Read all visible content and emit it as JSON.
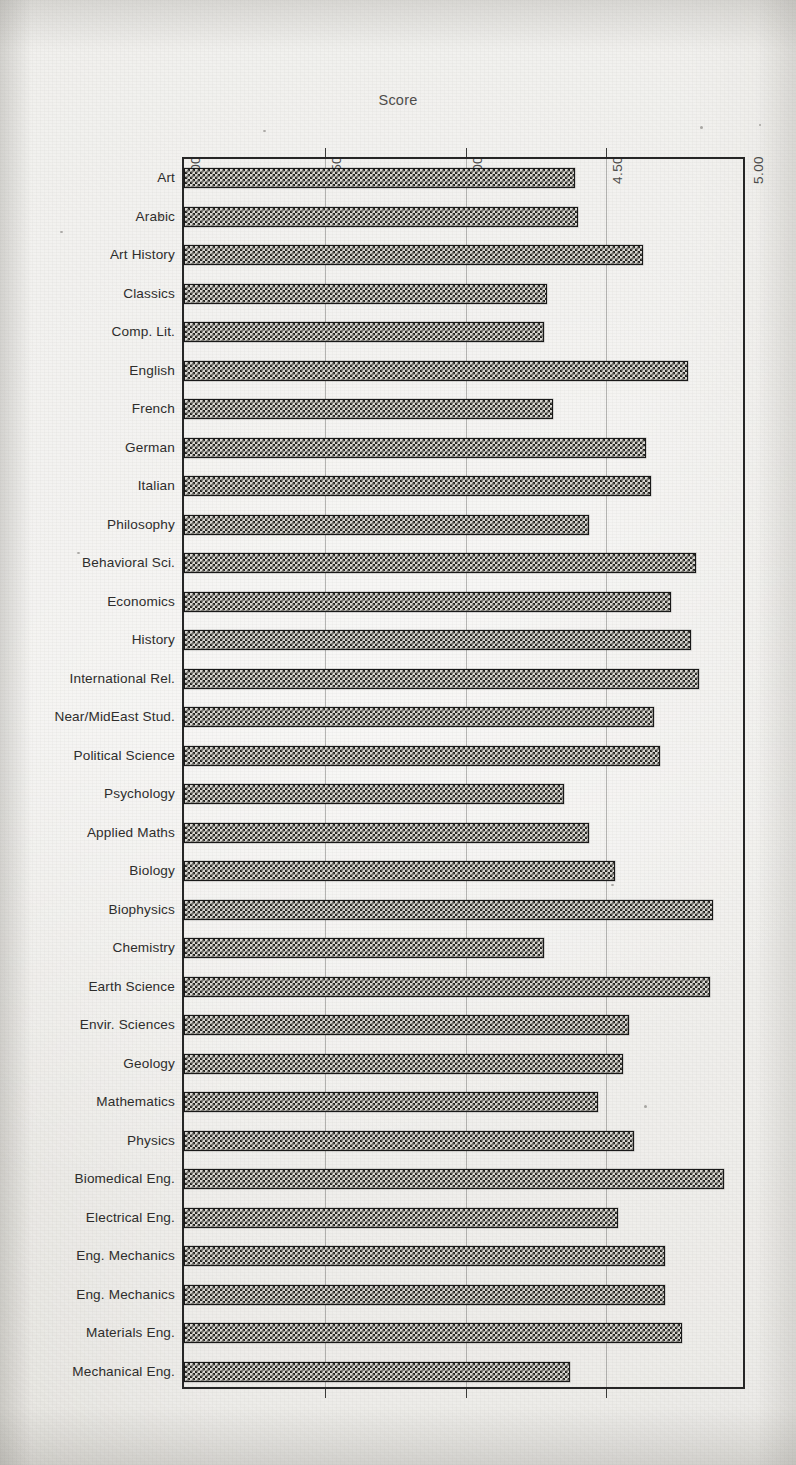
{
  "chart_data": {
    "type": "bar",
    "orientation": "horizontal",
    "title": "",
    "xlabel": "Score",
    "ylabel": "",
    "xlim": [
      3.0,
      5.0
    ],
    "xticks": [
      3.0,
      3.5,
      4.0,
      4.5,
      5.0
    ],
    "xtick_labels": [
      "3.00",
      "3.50",
      "4.00",
      "4.50",
      "5.00"
    ],
    "grid": true,
    "gridlines_at": [
      3.5,
      4.0,
      4.5
    ],
    "legend": null,
    "bar_fill": "checkerboard-hatch",
    "categories": [
      "Art",
      "Arabic",
      "Art History",
      "Classics",
      "Comp. Lit.",
      "English",
      "French",
      "German",
      "Italian",
      "Philosophy",
      "Behavioral Sci.",
      "Economics",
      "History",
      "International Rel.",
      "Near/MidEast Stud.",
      "Political  Science",
      "Psychology",
      "Applied Maths",
      "Biology",
      "Biophysics",
      "Chemistry",
      "Earth Science",
      "Envir. Sciences",
      "Geology",
      "Mathematics",
      "Physics",
      "Biomedical Eng.",
      "Electrical Eng.",
      "Eng. Mechanics",
      "Eng. Mechanics",
      "Materials  Eng.",
      "Mechanical Eng."
    ],
    "values": [
      4.39,
      4.4,
      4.63,
      4.29,
      4.28,
      4.79,
      4.31,
      4.64,
      4.66,
      4.44,
      4.82,
      4.73,
      4.8,
      4.83,
      4.67,
      4.69,
      4.35,
      4.44,
      4.53,
      4.88,
      4.28,
      4.87,
      4.58,
      4.56,
      4.47,
      4.6,
      4.92,
      4.54,
      4.71,
      4.71,
      4.77,
      4.37
    ]
  },
  "axis": {
    "title": "Score"
  },
  "colors": {
    "paper": "#e9e8e4",
    "ink": "#222222",
    "bar_ink": "#23231f",
    "gridline": "#5a5a58",
    "frame": "#262626"
  }
}
